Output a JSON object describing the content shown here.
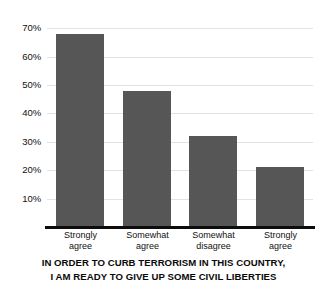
{
  "chart_data": {
    "type": "bar",
    "title": "",
    "subtitle": "",
    "caption_lines": [
      "IN ORDER TO CURB TERRORISM IN THIS COUNTRY,",
      "I AM READY TO GIVE UP SOME CIVIL LIBERTIES"
    ],
    "categories": [
      "Strongly\nagree",
      "Somewhat\nagree",
      "Somewhat\ndisagree",
      "Strongly\nagree"
    ],
    "category_lines": [
      [
        "Strongly",
        "agree"
      ],
      [
        "Somewhat",
        "agree"
      ],
      [
        "Somewhat",
        "disagree"
      ],
      [
        "Strongly",
        "agree"
      ]
    ],
    "values": [
      68,
      48,
      32,
      21
    ],
    "value_labels": [
      "68%",
      "48%",
      "32%",
      "21%"
    ],
    "xlabel": "",
    "ylabel": "",
    "ylim": [
      0,
      75
    ],
    "yticks": [
      10,
      20,
      30,
      40,
      50,
      60,
      70
    ],
    "ytick_labels": [
      "10%",
      "20%",
      "30%",
      "40%",
      "50%",
      "60%",
      "70%"
    ],
    "grid": true,
    "grid_axis": "y",
    "legend": false,
    "legend_position": "none",
    "bar_color": "#565656",
    "gridline_color": "#e2e2e2",
    "axis_color": "#0d0d0d",
    "background_color": "#ffffff",
    "text_color": "#111111"
  }
}
